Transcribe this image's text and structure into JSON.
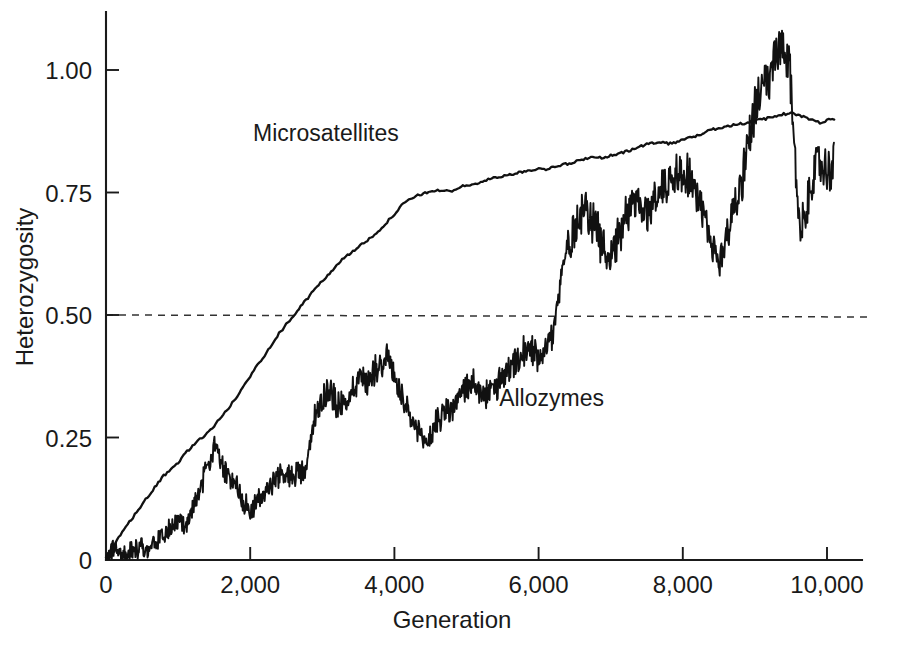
{
  "chart_data": {
    "type": "line",
    "title": "",
    "xlabel": "Generation",
    "ylabel": "Heterozygosity",
    "xlim": [
      0,
      10400
    ],
    "ylim": [
      0,
      1.12
    ],
    "grid": false,
    "legend_position": "inline-annotations",
    "xticks": [
      0,
      2000,
      4000,
      6000,
      8000,
      10000
    ],
    "xticklabels": [
      "0",
      "2,000",
      "4,000",
      "6,000",
      "8,000",
      "10,000"
    ],
    "yticks": [
      0,
      0.25,
      0.5,
      0.75,
      1.0
    ],
    "yticklabels": [
      "0",
      "0.25",
      "0.50",
      "0.75",
      "1.00"
    ],
    "reference_line": {
      "label": "0.50 reference",
      "y": 0.5,
      "style": "dashed",
      "color": "#333333"
    },
    "series": [
      {
        "name": "Microsatellites",
        "color": "#111111",
        "style": "smooth",
        "label_x": 3050,
        "label_y": 0.855,
        "x": [
          0,
          100,
          200,
          300,
          400,
          500,
          600,
          700,
          800,
          900,
          1000,
          1100,
          1200,
          1300,
          1400,
          1500,
          1600,
          1700,
          1800,
          1900,
          2000,
          2100,
          2200,
          2300,
          2400,
          2500,
          2600,
          2700,
          2800,
          2900,
          3000,
          3100,
          3200,
          3300,
          3400,
          3500,
          3600,
          3700,
          3800,
          3900,
          4000,
          4100,
          4200,
          4300,
          4400,
          4500,
          4600,
          4700,
          4800,
          4900,
          5000,
          5100,
          5200,
          5300,
          5400,
          5500,
          5600,
          5700,
          5800,
          5900,
          6000,
          6100,
          6200,
          6300,
          6400,
          6500,
          6600,
          6700,
          6800,
          6900,
          7000,
          7100,
          7200,
          7300,
          7400,
          7500,
          7600,
          7700,
          7800,
          7900,
          8000,
          8100,
          8200,
          8300,
          8400,
          8500,
          8600,
          8700,
          8800,
          8900,
          9000,
          9100,
          9200,
          9300,
          9400,
          9500,
          9600,
          9700,
          9800,
          9900,
          10000,
          10100
        ],
        "values": [
          0.005,
          0.028,
          0.05,
          0.072,
          0.093,
          0.113,
          0.133,
          0.152,
          0.172,
          0.183,
          0.199,
          0.218,
          0.233,
          0.246,
          0.258,
          0.274,
          0.292,
          0.31,
          0.33,
          0.352,
          0.375,
          0.398,
          0.418,
          0.441,
          0.462,
          0.481,
          0.498,
          0.517,
          0.535,
          0.553,
          0.569,
          0.585,
          0.602,
          0.616,
          0.628,
          0.638,
          0.649,
          0.661,
          0.675,
          0.69,
          0.706,
          0.723,
          0.735,
          0.742,
          0.748,
          0.752,
          0.755,
          0.752,
          0.754,
          0.76,
          0.765,
          0.767,
          0.77,
          0.776,
          0.781,
          0.784,
          0.786,
          0.789,
          0.793,
          0.796,
          0.798,
          0.798,
          0.802,
          0.806,
          0.808,
          0.812,
          0.818,
          0.82,
          0.823,
          0.821,
          0.825,
          0.828,
          0.833,
          0.838,
          0.843,
          0.848,
          0.852,
          0.853,
          0.85,
          0.853,
          0.858,
          0.862,
          0.866,
          0.872,
          0.878,
          0.882,
          0.885,
          0.888,
          0.89,
          0.893,
          0.896,
          0.899,
          0.902,
          0.906,
          0.91,
          0.912,
          0.908,
          0.903,
          0.898,
          0.893,
          0.897,
          0.901
        ]
      },
      {
        "name": "Allozymes",
        "color": "#111111",
        "style": "noisy",
        "label_x": 6180,
        "label_y": 0.315,
        "x": [
          0,
          100,
          200,
          300,
          400,
          500,
          600,
          700,
          800,
          900,
          1000,
          1100,
          1200,
          1300,
          1400,
          1500,
          1600,
          1700,
          1800,
          1900,
          2000,
          2100,
          2200,
          2300,
          2400,
          2500,
          2600,
          2700,
          2800,
          2900,
          3000,
          3100,
          3200,
          3300,
          3400,
          3500,
          3600,
          3700,
          3800,
          3900,
          4000,
          4100,
          4200,
          4300,
          4400,
          4500,
          4600,
          4700,
          4800,
          4900,
          5000,
          5100,
          5200,
          5300,
          5400,
          5500,
          5600,
          5700,
          5800,
          5900,
          6000,
          6100,
          6200,
          6300,
          6400,
          6500,
          6600,
          6700,
          6800,
          6900,
          7000,
          7100,
          7200,
          7300,
          7400,
          7500,
          7600,
          7700,
          7800,
          7900,
          8000,
          8100,
          8200,
          8300,
          8400,
          8500,
          8600,
          8700,
          8800,
          8900,
          9000,
          9100,
          9200,
          9300,
          9400,
          9500,
          9600,
          9700,
          9800,
          9900,
          10000,
          10100
        ],
        "values": [
          0.005,
          0.02,
          0.018,
          0.014,
          0.02,
          0.028,
          0.023,
          0.036,
          0.056,
          0.062,
          0.082,
          0.068,
          0.1,
          0.14,
          0.185,
          0.24,
          0.195,
          0.163,
          0.16,
          0.12,
          0.1,
          0.118,
          0.135,
          0.158,
          0.17,
          0.172,
          0.176,
          0.182,
          0.198,
          0.3,
          0.33,
          0.35,
          0.32,
          0.312,
          0.345,
          0.375,
          0.36,
          0.386,
          0.4,
          0.42,
          0.372,
          0.33,
          0.29,
          0.268,
          0.238,
          0.252,
          0.288,
          0.302,
          0.31,
          0.332,
          0.35,
          0.368,
          0.33,
          0.338,
          0.352,
          0.368,
          0.388,
          0.4,
          0.42,
          0.43,
          0.418,
          0.44,
          0.46,
          0.56,
          0.64,
          0.68,
          0.718,
          0.712,
          0.672,
          0.64,
          0.62,
          0.66,
          0.7,
          0.74,
          0.72,
          0.7,
          0.74,
          0.76,
          0.772,
          0.79,
          0.8,
          0.78,
          0.745,
          0.69,
          0.64,
          0.6,
          0.66,
          0.72,
          0.76,
          0.84,
          0.93,
          0.95,
          0.98,
          1.03,
          1.045,
          0.98,
          0.7,
          0.69,
          0.79,
          0.81,
          0.79,
          0.81
        ]
      }
    ]
  },
  "axes": {
    "y_title": "Heterozygosity",
    "x_title": "Generation"
  }
}
